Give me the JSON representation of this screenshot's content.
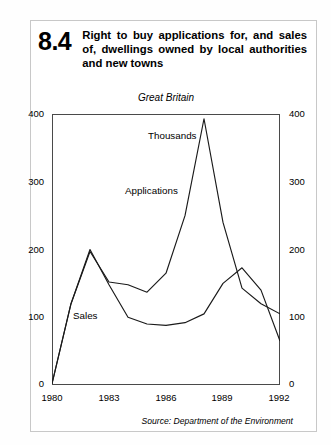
{
  "header": {
    "number": "8.4",
    "title": "Right to buy applications for, and sales of, dwellings owned by local authorities and new towns"
  },
  "chart_labels": {
    "subtitle": "Great Britain",
    "unit": "Thousands",
    "source": "Source: Department of the Environment",
    "series_applications": "Applications",
    "series_sales": "Sales"
  },
  "chart_data": {
    "type": "line",
    "title": "Right to buy applications for, and sales of, dwellings owned by local authorities and new towns",
    "subtitle": "Great Britain",
    "xlabel": "",
    "ylabel": "Thousands",
    "unit": "Thousands",
    "source": "Source: Department of the Environment",
    "grid": false,
    "legend_position": "inline-annotation",
    "xlim": [
      1980,
      1992
    ],
    "ylim": [
      0,
      400
    ],
    "yticks": [
      0,
      100,
      200,
      300,
      400
    ],
    "xticks": [
      1980,
      1983,
      1986,
      1989,
      1992
    ],
    "dual_axis": true,
    "x": [
      1980,
      1981,
      1982,
      1983,
      1984,
      1985,
      1986,
      1987,
      1988,
      1989,
      1990,
      1991,
      1992
    ],
    "series": [
      {
        "name": "Applications",
        "values": [
          2,
          120,
          197,
          152,
          148,
          137,
          165,
          250,
          393,
          240,
          143,
          120,
          105
        ]
      },
      {
        "name": "Sales",
        "values": [
          2,
          120,
          200,
          148,
          100,
          90,
          88,
          92,
          105,
          150,
          173,
          140,
          65
        ]
      }
    ],
    "annotations": [
      {
        "text": "Thousands",
        "x": 1985.7,
        "y": 378
      },
      {
        "text": "Applications",
        "x": 1984.6,
        "y": 297
      },
      {
        "text": "Sales",
        "x": 1982.0,
        "y": 101
      }
    ]
  },
  "axis": {
    "y_ticks": [
      "400",
      "300",
      "200",
      "100",
      "0"
    ],
    "x_ticks": [
      "1980",
      "1983",
      "1986",
      "1989",
      "1992"
    ]
  }
}
